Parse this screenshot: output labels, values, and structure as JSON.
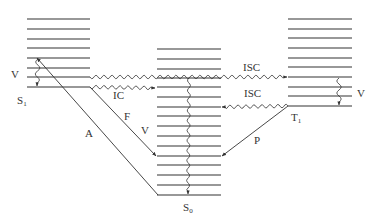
{
  "diagram": {
    "type": "jablonski",
    "colors": {
      "stroke": "#333333",
      "background": "#ffffff"
    },
    "states": {
      "S1": {
        "label": "S",
        "sub": "1",
        "x1": 27,
        "x2": 90,
        "levels": [
          19,
          29,
          39,
          48,
          58,
          68,
          77,
          87
        ]
      },
      "S0": {
        "label": "S",
        "sub": "0",
        "x1": 157,
        "x2": 221,
        "levels": [
          49,
          59,
          69,
          78,
          87,
          97,
          107,
          116,
          126,
          136,
          146,
          156,
          165,
          175,
          185,
          195
        ]
      },
      "T1": {
        "label": "T",
        "sub": "1",
        "x1": 288,
        "x2": 352,
        "levels": [
          19,
          29,
          38,
          48,
          58,
          67,
          77,
          87,
          96,
          106
        ]
      }
    },
    "labels": {
      "vib_s1": "V",
      "vib_s0": "V",
      "vib_t1": "V",
      "absorption": "A",
      "fluorescence": "F",
      "phosphorescence": "P",
      "internal_conversion": "IC",
      "isc_s1_t1": "ISC",
      "isc_t1_s0": "ISC",
      "s1_label": "S",
      "s1_sub": "1",
      "s0_label": "S",
      "s0_sub": "0",
      "t1_label": "T",
      "t1_sub": "1"
    },
    "transitions": [
      {
        "name": "A",
        "kind": "radiative",
        "from": "S0 (0)",
        "to": "S1 (v=3)"
      },
      {
        "name": "F",
        "kind": "radiative",
        "from": "S1 (0)",
        "to": "S0 (v)"
      },
      {
        "name": "P",
        "kind": "radiative",
        "from": "T1 (0)",
        "to": "S0 (v)"
      },
      {
        "name": "IC",
        "kind": "nonradiative",
        "from": "S1 (0)",
        "to": "S0 (v)"
      },
      {
        "name": "ISC",
        "kind": "nonradiative",
        "from": "S1",
        "to": "T1"
      },
      {
        "name": "ISC",
        "kind": "nonradiative",
        "from": "T1 (0)",
        "to": "S0 (v)"
      },
      {
        "name": "V",
        "kind": "vibrational relaxation",
        "state": "S1"
      },
      {
        "name": "V",
        "kind": "vibrational relaxation",
        "state": "S0"
      },
      {
        "name": "V",
        "kind": "vibrational relaxation",
        "state": "T1"
      }
    ]
  }
}
